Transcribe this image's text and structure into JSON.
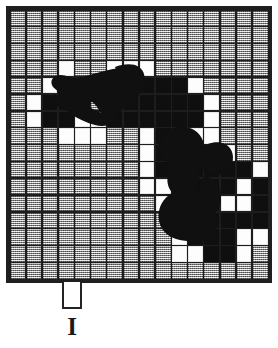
{
  "figure": {
    "kind": "halftone-scan-grid-diagram",
    "label": "I",
    "background_color": "#ffffff",
    "border_color": "#1f1f1f",
    "cell_fill_color": "#b9b9b9",
    "empty_cell_color": "#fdfdfd",
    "ink_color": "#0f0f0f"
  },
  "grid": {
    "columns": 16,
    "rows": 16,
    "cell_texture": "dithered-halftone-gray",
    "panel_width_px": 266,
    "panel_height_px": 277,
    "states": [
      "gggggggggggggggg",
      "gggggggggggggggg",
      "gggggggggggggggg",
      "ggge..eeegggggg g",
      "ggekkkkkkkkeggg g",
      "gekkkggkkkkkeg gg",
      "gekkeekkkkkkegggg",
      "gggeeeggekkeegggg",
      "ggggggggekkkkeggg",
      "ggggggggekkkkkkeg",
      "ggggggggeekkkkekg",
      "gggggggggekkkeekg",
      "ggggggggggkkkkkkg",
      "ggggggggggekkkeeg",
      "ggggggggggeekkegg",
      "gggggggggggggggg"
    ],
    "legend": {
      "g": "textured gray cell",
      "e": "empty white cell",
      "k": "black ink cell"
    }
  },
  "blobs": [
    {
      "name": "upper-left-ink-blob",
      "description": "irregular filled black region in upper-left quadrant"
    },
    {
      "name": "lower-right-ink-blob",
      "description": "irregular filled black region in lower-right quadrant"
    }
  ],
  "notch": {
    "name": "bottom-tab",
    "width_px": 20,
    "height_px": 27,
    "fill": "#ffffff",
    "stroke": "#242424"
  }
}
